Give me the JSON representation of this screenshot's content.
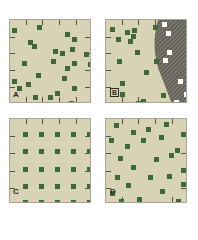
{
  "colors": {
    "background": "#d9d3b6",
    "border": "#a7a498",
    "dot": "#3d6a37",
    "hatch_fill": "#7a776e",
    "hatch_line": "#4a4843",
    "white_dot": "#ffffff"
  },
  "panels": [
    {
      "id": "A",
      "label": "A",
      "pattern": "random",
      "dots": [
        [
          2,
          8
        ],
        [
          27,
          5
        ],
        [
          55,
          12
        ],
        [
          62,
          17
        ],
        [
          18,
          20
        ],
        [
          22,
          24
        ],
        [
          43,
          29
        ],
        [
          50,
          31
        ],
        [
          60,
          27
        ],
        [
          74,
          32
        ],
        [
          41,
          39
        ],
        [
          12,
          41
        ],
        [
          62,
          41
        ],
        [
          78,
          42
        ],
        [
          55,
          46
        ],
        [
          26,
          53
        ],
        [
          52,
          56
        ],
        [
          2,
          59
        ],
        [
          16,
          62
        ],
        [
          7,
          66
        ],
        [
          62,
          66
        ],
        [
          45,
          71
        ],
        [
          23,
          75
        ],
        [
          38,
          75
        ],
        [
          59,
          81
        ]
      ]
    },
    {
      "id": "B",
      "label": "B",
      "pattern": "random-with-barrier",
      "dots": [
        [
          4,
          7
        ],
        [
          19,
          10
        ],
        [
          26,
          8
        ],
        [
          25,
          14
        ],
        [
          22,
          19
        ],
        [
          10,
          17
        ],
        [
          47,
          5
        ],
        [
          29,
          30
        ],
        [
          11,
          39
        ],
        [
          48,
          39
        ],
        [
          38,
          50
        ],
        [
          14,
          61
        ],
        [
          14,
          72
        ],
        [
          55,
          73
        ],
        [
          35,
          79
        ],
        [
          30,
          81
        ]
      ],
      "white_dots": [
        [
          56,
          2
        ],
        [
          60,
          11
        ],
        [
          61,
          30
        ],
        [
          57,
          38
        ],
        [
          72,
          59
        ],
        [
          78,
          72
        ],
        [
          68,
          80
        ]
      ]
    },
    {
      "id": "C",
      "label": "C",
      "pattern": "uniform-grid",
      "dots": [
        [
          13,
          13
        ],
        [
          29,
          13
        ],
        [
          45,
          13
        ],
        [
          61,
          13
        ],
        [
          77,
          13
        ],
        [
          13,
          30
        ],
        [
          29,
          30
        ],
        [
          45,
          30
        ],
        [
          61,
          30
        ],
        [
          77,
          30
        ],
        [
          13,
          48
        ],
        [
          29,
          48
        ],
        [
          45,
          48
        ],
        [
          61,
          48
        ],
        [
          77,
          48
        ],
        [
          13,
          65
        ],
        [
          29,
          65
        ],
        [
          45,
          65
        ],
        [
          61,
          65
        ],
        [
          77,
          65
        ],
        [
          13,
          81
        ],
        [
          29,
          81
        ],
        [
          45,
          81
        ],
        [
          61,
          81
        ],
        [
          77,
          81
        ]
      ]
    },
    {
      "id": "D",
      "label": "D",
      "pattern": "semi-regular",
      "dots": [
        [
          8,
          4
        ],
        [
          25,
          11
        ],
        [
          40,
          8
        ],
        [
          58,
          3
        ],
        [
          75,
          13
        ],
        [
          3,
          19
        ],
        [
          19,
          25
        ],
        [
          35,
          19
        ],
        [
          53,
          16
        ],
        [
          69,
          29
        ],
        [
          12,
          37
        ],
        [
          48,
          38
        ],
        [
          63,
          34
        ],
        [
          25,
          46
        ],
        [
          75,
          49
        ],
        [
          9,
          56
        ],
        [
          42,
          56
        ],
        [
          61,
          55
        ],
        [
          20,
          64
        ],
        [
          75,
          63
        ],
        [
          4,
          72
        ],
        [
          54,
          70
        ],
        [
          31,
          78
        ],
        [
          13,
          80
        ],
        [
          70,
          80
        ]
      ]
    }
  ]
}
